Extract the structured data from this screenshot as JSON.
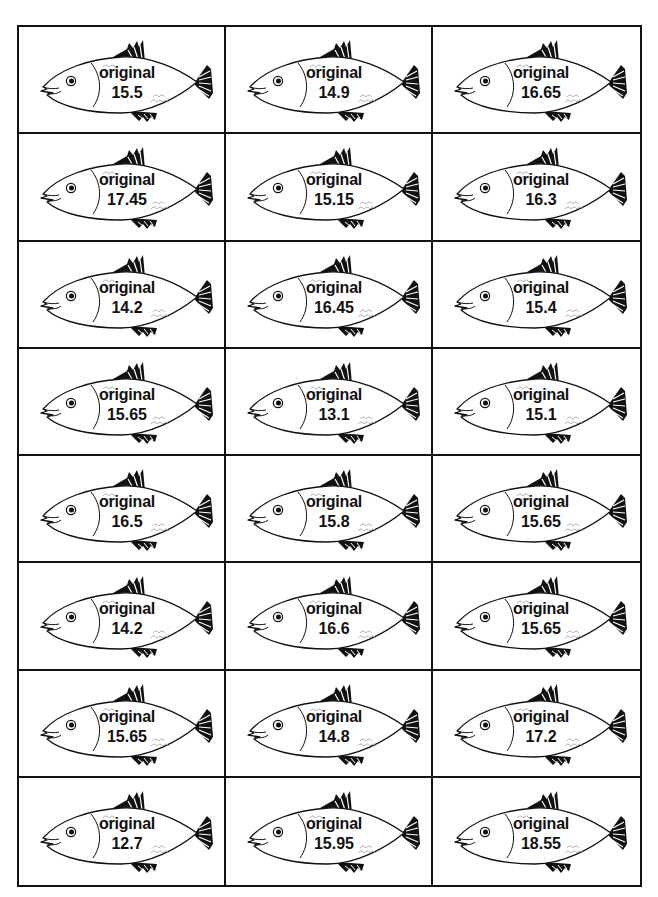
{
  "sheet": {
    "label_word": "original",
    "cards": [
      {
        "label": "original",
        "value": "15.5"
      },
      {
        "label": "original",
        "value": "14.9"
      },
      {
        "label": "original",
        "value": "16.65"
      },
      {
        "label": "original",
        "value": "17.45"
      },
      {
        "label": "original",
        "value": "15.15"
      },
      {
        "label": "original",
        "value": "16.3"
      },
      {
        "label": "original",
        "value": "14.2"
      },
      {
        "label": "original",
        "value": "16.45"
      },
      {
        "label": "original",
        "value": "15.4"
      },
      {
        "label": "original",
        "value": "15.65"
      },
      {
        "label": "original",
        "value": "13.1"
      },
      {
        "label": "original",
        "value": "15.1"
      },
      {
        "label": "original",
        "value": "16.5"
      },
      {
        "label": "original",
        "value": "15.8"
      },
      {
        "label": "original",
        "value": "15.65"
      },
      {
        "label": "original",
        "value": "14.2"
      },
      {
        "label": "original",
        "value": "16.6"
      },
      {
        "label": "original",
        "value": "15.65"
      },
      {
        "label": "original",
        "value": "15.65"
      },
      {
        "label": "original",
        "value": "14.8"
      },
      {
        "label": "original",
        "value": "17.2"
      },
      {
        "label": "original",
        "value": "12.7"
      },
      {
        "label": "original",
        "value": "15.95"
      },
      {
        "label": "original",
        "value": "18.55"
      }
    ],
    "icon": "fish-icon",
    "colors": {
      "line": "#111111",
      "background": "#ffffff",
      "scale_line": "#999999"
    }
  }
}
